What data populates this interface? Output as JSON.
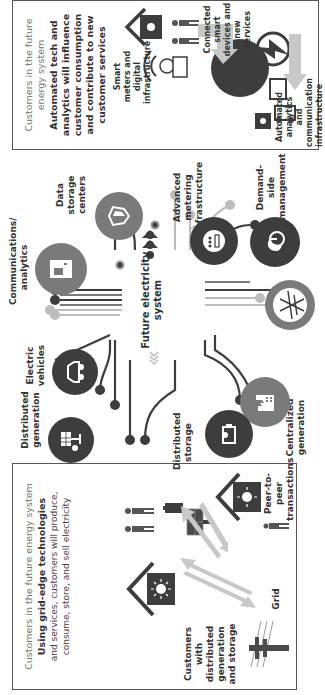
{
  "left_panel": {
    "title": "Customers in the future energy system",
    "headline": "Using grid-edge technologies",
    "body": "and services, customers will produce, consume, store, and sell electricity",
    "labels": {
      "customers": "Customers with distributed generation and storage",
      "peer": "Peer-to-peer transactions",
      "grid": "Grid"
    }
  },
  "center": {
    "title": "Future electricity system",
    "nodes": [
      {
        "id": "distributed-generation",
        "label": "Distributed generation",
        "icon": "solar-panel-icon"
      },
      {
        "id": "electric-vehicles",
        "label": "Electric vehicles",
        "icon": "car-icon"
      },
      {
        "id": "communications-analytics",
        "label": "Communications/ analytics",
        "icon": "server-icon"
      },
      {
        "id": "data-storage-centers",
        "label": "Data storage centers",
        "icon": "shield-icon"
      },
      {
        "id": "advanced-metering",
        "label": "Advanced metering infrastructure",
        "icon": "meter-icon"
      },
      {
        "id": "demand-side-management",
        "label": "Demand-side management",
        "icon": "power-leaf-icon"
      },
      {
        "id": "centralized-generation",
        "label": "Centralized generation",
        "icon": "factory-icon"
      },
      {
        "id": "distributed-storage",
        "label": "Distributed storage",
        "icon": "battery-icon"
      },
      {
        "id": "transmission",
        "label": "",
        "icon": "transmission-tower-icon"
      }
    ]
  },
  "right_panel": {
    "title": "Customers in the future energy system",
    "headline": "Automated tech and analytics will influence customer consumption and contribute to new customer services",
    "labels": {
      "smart_meters": "Smart meters and digital infrastructure",
      "connected": "Connected smart devices and new services",
      "automated": "Automated analytics and communication infrastructure"
    }
  },
  "colors": {
    "dark": "#3d3d3d",
    "mid": "#7a7a7a",
    "light": "#bdbdbd",
    "arrow": "#c8c8c8"
  }
}
